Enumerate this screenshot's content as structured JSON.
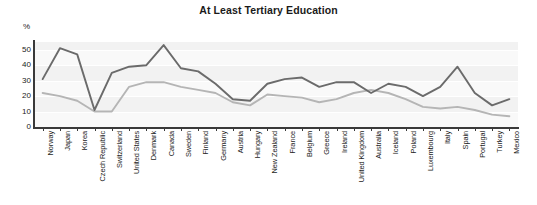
{
  "chart_data": {
    "type": "line",
    "title": "At Least Tertiary Education",
    "xlabel": "",
    "ylabel": "%",
    "ylim": [
      0,
      55
    ],
    "yticks": [
      0,
      10,
      20,
      30,
      40,
      50
    ],
    "grid": true,
    "legend_position": "none",
    "categories": [
      "Norway",
      "Japan",
      "Korea",
      "Czech Republic",
      "Switzerland",
      "United States",
      "Denmark",
      "Canada",
      "Sweden",
      "Finland",
      "Germany",
      "Austria",
      "Hungary",
      "New Zealand",
      "France",
      "Belgium",
      "Greece",
      "Ireland",
      "United Kingdom",
      "Australia",
      "Iceland",
      "Poland",
      "Luxembourg",
      "Italy",
      "Spain",
      "Portugal",
      "Turkey",
      "Mexico"
    ],
    "series": [
      {
        "name": "Younger cohort",
        "color": "#6b6b6b",
        "values": [
          31,
          51,
          47,
          11,
          35,
          39,
          40,
          53,
          38,
          36,
          28,
          18,
          17,
          28,
          31,
          32,
          26,
          29,
          29,
          22,
          28,
          26,
          20,
          26,
          39,
          22,
          14,
          18
        ]
      },
      {
        "name": "Older cohort",
        "color": "#b5b5b5",
        "values": [
          22,
          20,
          17,
          10,
          10,
          26,
          29,
          29,
          26,
          24,
          22,
          16,
          14,
          21,
          20,
          19,
          16,
          18,
          22,
          24,
          22,
          18,
          13,
          12,
          13,
          11,
          8,
          7
        ]
      }
    ]
  }
}
